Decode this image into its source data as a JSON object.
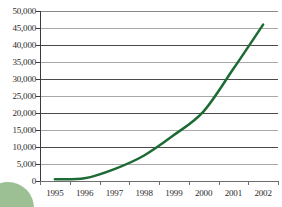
{
  "chart_data": {
    "type": "line",
    "title": "",
    "title_clipped": true,
    "xlabel": "",
    "ylabel": "",
    "x": [
      1995,
      1996,
      1997,
      1998,
      1999,
      2000,
      2001,
      2002
    ],
    "categories": [
      "1995",
      "1996",
      "1997",
      "1998",
      "1999",
      "2000",
      "2001",
      "2002"
    ],
    "series": [
      {
        "name": "",
        "color": "#1d6b34",
        "values": [
          500,
          800,
          3500,
          7500,
          13500,
          20500,
          33000,
          46000
        ]
      }
    ],
    "ylim": [
      0,
      50000
    ],
    "yticks": [
      0,
      5000,
      10000,
      15000,
      20000,
      25000,
      30000,
      35000,
      40000,
      45000,
      50000
    ],
    "ytick_labels": [
      "0",
      "5,000",
      "10,000",
      "15,000",
      "20,000",
      "25,000",
      "30,000",
      "35,000",
      "40,000",
      "45,000",
      "50,000"
    ],
    "xtick_labels": [
      "1995",
      "1996",
      "1997",
      "1998",
      "1999",
      "2000",
      "2001",
      "2002"
    ],
    "grid": true,
    "grid_axis": "y",
    "legend": false,
    "legend_position": "none",
    "line_width": 2.5,
    "smooth": true
  },
  "decoration": {
    "circle_color": "#9cbf93",
    "circle_name": "decorative-green-circle"
  },
  "colors": {
    "line": "#1d6b34",
    "grid_dark": "#4a4a4a",
    "grid_light": "#a8a8a8",
    "axis": "#3c3c3c",
    "text": "#2b2b2b",
    "background": "#ffffff"
  }
}
